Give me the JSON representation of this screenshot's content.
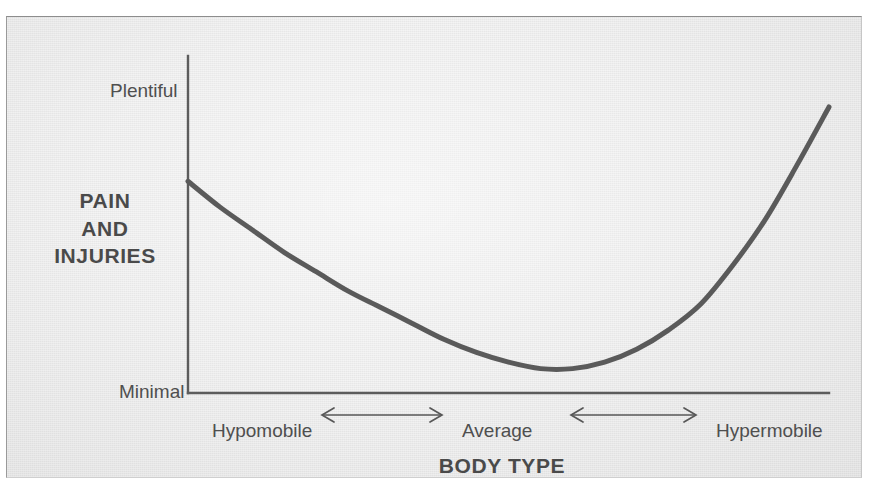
{
  "chart_data": {
    "type": "line",
    "title": "",
    "subtitle": "",
    "xlabel": "BODY TYPE",
    "ylabel": "PAIN AND INJURIES",
    "ylabel_lines": [
      "PAIN",
      "AND",
      "INJURIES"
    ],
    "y_tick_labels": [
      "Plentiful",
      "Minimal"
    ],
    "y_ticks_top_label": "Plentiful",
    "y_ticks_bottom_label": "Minimal",
    "x_tick_labels": [
      "Hypomobile",
      "Average",
      "Hypermobile"
    ],
    "x_axis_connectors": [
      "⟵⟶",
      "⟵⟶"
    ],
    "grid": false,
    "legend": "none",
    "ylim": [
      0,
      100
    ],
    "xlim": [
      0,
      100
    ],
    "annotations": [],
    "series": [
      {
        "name": "Pain and injuries",
        "color": "#5a5a5a",
        "line_width": 5,
        "x": [
          0,
          5,
          10,
          15,
          20,
          25,
          30,
          35,
          40,
          45,
          50,
          55,
          60,
          65,
          70,
          75,
          80,
          85,
          90,
          95,
          100
        ],
        "y": [
          64,
          56,
          49,
          42,
          36,
          30,
          25,
          20,
          15,
          11,
          8,
          6,
          6,
          8,
          12,
          18,
          26,
          38,
          52,
          69,
          87
        ]
      }
    ]
  },
  "figure": {
    "background_color": "#e9e9e9",
    "page_color": "#ffffff",
    "ink_color": "#4a4a4a",
    "curve_color": "#5a5a5a",
    "axis_color": "#5c5c5c"
  }
}
